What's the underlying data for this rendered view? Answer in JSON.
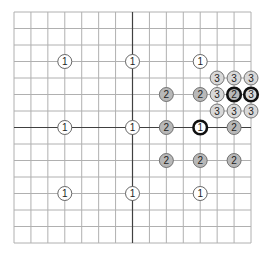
{
  "diagram": {
    "title": "",
    "grid": {
      "columns": 14,
      "rows": 14,
      "left": 14,
      "top": 12,
      "right": 251,
      "bottom": 243,
      "line_color": "#b0b0b0",
      "axis_color": "#404040",
      "axis_column": 7,
      "axis_row": 7
    },
    "styles": {
      "1": {
        "fill": "#ffffff",
        "stroke": "#555555"
      },
      "2": {
        "fill": "#b8b8b8",
        "stroke": "#666666"
      },
      "3": {
        "fill": "#d8d8d8",
        "stroke": "#666666"
      }
    },
    "markers": [
      {
        "label": "1",
        "col": 3,
        "row": 3,
        "level": "1",
        "bold": false
      },
      {
        "label": "1",
        "col": 7,
        "row": 3,
        "level": "1",
        "bold": false
      },
      {
        "label": "1",
        "col": 11,
        "row": 3,
        "level": "1",
        "bold": false
      },
      {
        "label": "1",
        "col": 3,
        "row": 7,
        "level": "1",
        "bold": false
      },
      {
        "label": "1",
        "col": 7,
        "row": 7,
        "level": "1",
        "bold": false
      },
      {
        "label": "1",
        "col": 11,
        "row": 7,
        "level": "1",
        "bold": true
      },
      {
        "label": "1",
        "col": 3,
        "row": 11,
        "level": "1",
        "bold": false
      },
      {
        "label": "1",
        "col": 7,
        "row": 11,
        "level": "1",
        "bold": false
      },
      {
        "label": "1",
        "col": 11,
        "row": 11,
        "level": "1",
        "bold": false
      },
      {
        "label": "2",
        "col": 9,
        "row": 5,
        "level": "2",
        "bold": false
      },
      {
        "label": "2",
        "col": 11,
        "row": 5,
        "level": "2",
        "bold": false
      },
      {
        "label": "2",
        "col": 9,
        "row": 7,
        "level": "2",
        "bold": false
      },
      {
        "label": "2",
        "col": 13,
        "row": 7,
        "level": "2",
        "bold": false
      },
      {
        "label": "2",
        "col": 9,
        "row": 9,
        "level": "2",
        "bold": false
      },
      {
        "label": "2",
        "col": 11,
        "row": 9,
        "level": "2",
        "bold": false
      },
      {
        "label": "2",
        "col": 13,
        "row": 9,
        "level": "2",
        "bold": false
      },
      {
        "label": "2",
        "col": 13,
        "row": 5,
        "level": "2",
        "bold": true
      },
      {
        "label": "3",
        "col": 12,
        "row": 4,
        "level": "3",
        "bold": false
      },
      {
        "label": "3",
        "col": 13,
        "row": 4,
        "level": "3",
        "bold": false
      },
      {
        "label": "3",
        "col": 14,
        "row": 4,
        "level": "3",
        "bold": false
      },
      {
        "label": "3",
        "col": 12,
        "row": 5,
        "level": "3",
        "bold": false
      },
      {
        "label": "3",
        "col": 14,
        "row": 5,
        "level": "3",
        "bold": true
      },
      {
        "label": "3",
        "col": 12,
        "row": 6,
        "level": "3",
        "bold": false
      },
      {
        "label": "3",
        "col": 13,
        "row": 6,
        "level": "3",
        "bold": false
      },
      {
        "label": "3",
        "col": 14,
        "row": 6,
        "level": "3",
        "bold": false
      }
    ]
  }
}
